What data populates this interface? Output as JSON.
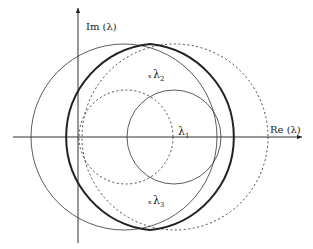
{
  "diagram": {
    "axes": {
      "x_label": "Re (λ)",
      "y_label": "Im (λ)"
    },
    "points": [
      {
        "name": "λ",
        "sub": "1",
        "marker": ""
      },
      {
        "name": "λ",
        "sub": "2",
        "marker": "x"
      },
      {
        "name": "λ",
        "sub": "3",
        "marker": "x"
      }
    ],
    "curves": [
      {
        "id": "large-solid-circle",
        "style": "thin solid"
      },
      {
        "id": "large-dashed-circle",
        "style": "dashed"
      },
      {
        "id": "small-dashed-circle",
        "style": "dashed"
      },
      {
        "id": "small-solid-circle",
        "style": "thin solid"
      },
      {
        "id": "lens-region",
        "style": "thick solid"
      }
    ],
    "colors": {
      "stroke": "#222222",
      "background": "#ffffff"
    }
  }
}
